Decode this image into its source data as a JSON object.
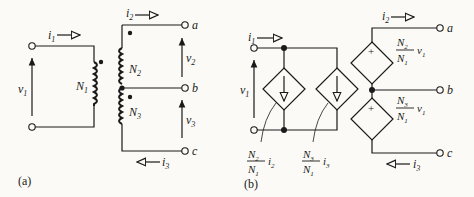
{
  "figure": {
    "panels": [
      {
        "label": "(a)",
        "title": "ideal transformer with tapped secondary",
        "primary": {
          "turns": "N",
          "turns_sub": "1",
          "voltage": "v",
          "voltage_sub": "1",
          "current": "i",
          "current_sub": "1"
        },
        "secondary_upper": {
          "turns": "N",
          "turns_sub": "2",
          "voltage": "v",
          "voltage_sub": "2",
          "current": "i",
          "current_sub": "2"
        },
        "secondary_lower": {
          "turns": "N",
          "turns_sub": "3",
          "voltage": "v",
          "voltage_sub": "3",
          "current": "i",
          "current_sub": "3"
        },
        "terminals": [
          "a",
          "b",
          "c"
        ]
      },
      {
        "label": "(b)",
        "title": "equivalent circuit with dependent sources",
        "source_i2": {
          "num": "N",
          "num_sub": "2",
          "den": "N",
          "den_sub": "1",
          "var": "i",
          "var_sub": "2"
        },
        "source_i3": {
          "num": "N",
          "num_sub": "3",
          "den": "N",
          "den_sub": "1",
          "var": "i",
          "var_sub": "3"
        },
        "source_v2": {
          "num": "N",
          "num_sub": "2",
          "den": "N",
          "den_sub": "1",
          "var": "v",
          "var_sub": "1",
          "sign": "+"
        },
        "source_v3": {
          "num": "N",
          "num_sub": "3",
          "den": "N",
          "den_sub": "1",
          "var": "v",
          "var_sub": "1",
          "sign": "+"
        },
        "terminals": [
          "a",
          "b",
          "c"
        ]
      }
    ]
  }
}
